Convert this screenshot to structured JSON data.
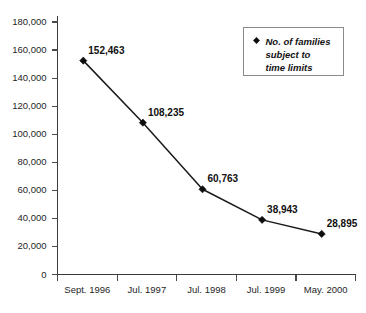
{
  "chart_data": {
    "type": "line",
    "title": "",
    "xlabel": "",
    "ylabel": "",
    "categories": [
      "Sept. 1996",
      "Jul. 1997",
      "Jul. 1998",
      "Jul. 1999",
      "May. 2000"
    ],
    "values": [
      152463,
      108235,
      60763,
      38943,
      28895
    ],
    "point_labels": [
      "152,463",
      "108,235",
      "60,763",
      "38,943",
      "28,895"
    ],
    "series": [
      {
        "name": "No. of families subject to time limits",
        "values": [
          152463,
          108235,
          60763,
          38943,
          28895
        ]
      }
    ],
    "ylim": [
      0,
      180000
    ],
    "ytick_values": [
      0,
      20000,
      40000,
      60000,
      80000,
      100000,
      120000,
      140000,
      160000,
      180000
    ],
    "ytick_labels": [
      "0",
      "20,000",
      "40,000",
      "60,000",
      "80,000",
      "100,000",
      "120,000",
      "140,000",
      "160,000",
      "180,000"
    ],
    "grid": false,
    "legend_position": "top-right",
    "legend_entries": [
      {
        "marker": "diamond",
        "marker_color": "#0d0d0d",
        "lines": [
          "No. of families",
          "subject to",
          "time limits"
        ]
      }
    ],
    "marker_shape": "diamond",
    "line_color": "#1a1a1a",
    "marker_color": "#0d0d0d",
    "background_color": "#ffffff"
  }
}
